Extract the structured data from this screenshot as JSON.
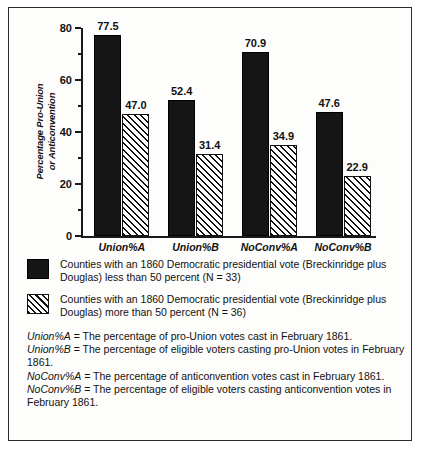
{
  "chart_data": {
    "type": "bar",
    "title": "",
    "xlabel": "",
    "ylabel": "Percentage Pro-Union\nor Anticonvention",
    "ylim": [
      0,
      80
    ],
    "yticks": [
      0,
      20,
      40,
      60,
      80
    ],
    "ytick_labels": [
      "0",
      "20",
      "40",
      "60",
      "80"
    ],
    "minor_tick_interval": 10,
    "grid": false,
    "legend_position": "below",
    "categories": [
      "Union%A",
      "Union%B",
      "NoConv%A",
      "NoConv%B"
    ],
    "series": [
      {
        "name": "Counties with an 1860 Democratic presidential vote (Breckinridge plus Douglas) less than 50 percent (N = 33)",
        "pattern": "solid",
        "color": "#151515",
        "values": [
          77.5,
          52.4,
          70.9,
          47.6
        ],
        "value_labels": [
          "77.5",
          "52.4",
          "70.9",
          "47.6"
        ]
      },
      {
        "name": "Counties with an 1860 Democratic presidential vote (Breckinridge plus Douglas) more than 50 percent (N = 36)",
        "pattern": "hatch",
        "color": "#ffffff",
        "values": [
          47.0,
          31.4,
          34.9,
          22.9
        ],
        "value_labels": [
          "47.0",
          "31.4",
          "34.9",
          "22.9"
        ]
      }
    ]
  },
  "axis": {
    "y_title_line1": "Percentage Pro-Union",
    "y_title_line2": "or Anticonvention"
  },
  "legend": {
    "items": [
      {
        "swatch": "solid-black-square",
        "text": "Counties with an 1860 Democratic presidential vote (Breckinridge plus Douglas) less than 50 percent (N = 33)"
      },
      {
        "swatch": "hatched-square",
        "text": "Counties with an 1860 Democratic presidential vote (Breckinridge plus Douglas) more than 50 percent (N = 36)"
      }
    ]
  },
  "footnotes": [
    {
      "term": "Union%A",
      "definition": " = The percentage of pro-Union votes cast in February 1861."
    },
    {
      "term": "Union%B",
      "definition": " = The percentage of eligible voters casting pro-Union votes in February 1861."
    },
    {
      "term": "NoConv%A",
      "definition": " = The percentage of anticonvention votes cast in February 1861."
    },
    {
      "term": "NoConv%B",
      "definition": " = The percentage of eligible voters casting anticonvention votes in February 1861."
    }
  ]
}
